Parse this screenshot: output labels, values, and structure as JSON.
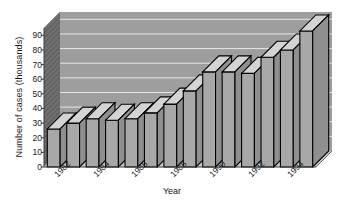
{
  "chart_data": {
    "type": "bar",
    "title": "",
    "xlabel": "Year",
    "ylabel": "Number of cases (thousands)",
    "categories": [
      "1982",
      "1983",
      "1984",
      "1985",
      "1986",
      "1987",
      "1988",
      "1989",
      "1990",
      "1991",
      "1992",
      "1993",
      "1994",
      "1995"
    ],
    "tick_labels_shown": [
      "1982",
      "1984",
      "1986",
      "1988",
      "1990",
      "1992",
      "1994"
    ],
    "values": [
      26,
      30,
      33,
      32,
      33,
      37,
      43,
      52,
      65,
      65,
      64,
      75,
      80,
      93
    ],
    "ylim": [
      0,
      95
    ],
    "yticks": [
      0,
      10,
      20,
      30,
      40,
      50,
      60,
      70,
      80,
      90
    ],
    "ytick_labels": [
      "0",
      "10",
      "20",
      "30",
      "40",
      "50",
      "60",
      "70",
      "80",
      "90"
    ],
    "grid": true,
    "grid_axis": "y",
    "style": "3d-bar",
    "legend": null,
    "colors": {
      "bar_front": "#a8a8a8",
      "bar_top": "#d4d4d4",
      "bar_side": "#8f8f8f",
      "bar_edge": "#000000",
      "plot_background": "#9e9e9e",
      "wall_back": "#9e9e9e",
      "wall_side": "#6e6e6e",
      "floor": "#c9c9c9",
      "gridline": "#e8e8e8",
      "text": "#1a1a1a"
    }
  }
}
